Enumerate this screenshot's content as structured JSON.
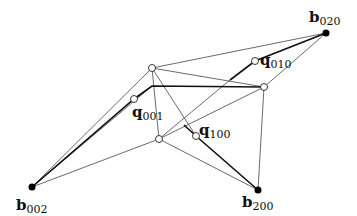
{
  "diagram": {
    "labels": {
      "b020": {
        "base": "b",
        "sub": "020"
      },
      "b002": {
        "base": "b",
        "sub": "002"
      },
      "b200": {
        "base": "b",
        "sub": "200"
      },
      "q010": {
        "base": "q",
        "sub": "010"
      },
      "q001": {
        "base": "q",
        "sub": "001"
      },
      "q100": {
        "base": "q",
        "sub": "100"
      }
    },
    "points": {
      "b020": [
        326,
        33
      ],
      "b002": [
        32,
        187
      ],
      "b200": [
        258,
        190
      ],
      "top": [
        152,
        68
      ],
      "right": [
        264,
        87
      ],
      "bottom": [
        159,
        139
      ],
      "q010": [
        255,
        61
      ],
      "q001": [
        134,
        99
      ],
      "q100": [
        196,
        136
      ]
    },
    "colors": {
      "line": "#333333",
      "fill_open": "#ffffff",
      "fill_solid": "#000000"
    }
  }
}
